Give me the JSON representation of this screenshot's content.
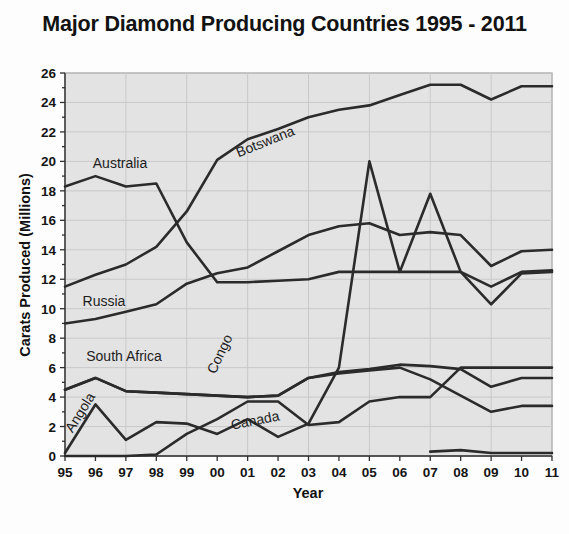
{
  "chart_data": {
    "type": "line",
    "title": "Major Diamond Producing Countries 1995 - 2011",
    "xlabel": "Year",
    "ylabel": "Carats Produced (Millions)",
    "categories": [
      "95",
      "96",
      "97",
      "98",
      "99",
      "00",
      "01",
      "02",
      "03",
      "04",
      "05",
      "06",
      "07",
      "08",
      "09",
      "10",
      "11"
    ],
    "x": [
      1995,
      1996,
      1997,
      1998,
      1999,
      2000,
      2001,
      2002,
      2003,
      2004,
      2005,
      2006,
      2007,
      2008,
      2009,
      2010,
      2011
    ],
    "xlim": [
      1995,
      2011
    ],
    "ylim": [
      0,
      26
    ],
    "ytick_step": 2,
    "yticks": [
      0,
      2,
      4,
      6,
      8,
      10,
      12,
      14,
      16,
      18,
      20,
      22,
      24,
      26
    ],
    "grid": true,
    "legend": "inline-labels",
    "series": [
      {
        "name": "Botswana",
        "label_x": 267,
        "label_y": 146,
        "label_rotate": -22,
        "values": [
          11.5,
          12.3,
          13.0,
          14.2,
          16.6,
          20.1,
          21.5,
          22.2,
          23.0,
          23.5,
          23.8,
          24.5,
          25.2,
          25.2,
          24.2,
          25.1,
          25.1
        ]
      },
      {
        "name": "Australia",
        "label_x": 120,
        "label_y": 168,
        "label_rotate": 0,
        "values": [
          18.3,
          19.0,
          18.3,
          18.5,
          14.5,
          11.8,
          11.8,
          11.9,
          12.0,
          12.5,
          12.5,
          12.5,
          12.5,
          12.5,
          11.5,
          12.5,
          12.6
        ]
      },
      {
        "name": "Russia",
        "label_x": 104,
        "label_y": 306,
        "label_rotate": 0,
        "values": [
          9.0,
          9.3,
          9.8,
          10.3,
          11.7,
          12.4,
          12.8,
          13.9,
          15.0,
          15.6,
          15.8,
          15.0,
          15.2,
          15.0,
          12.9,
          13.9,
          14.0
        ]
      },
      {
        "name": "Congo",
        "label_x": 224,
        "label_y": 356,
        "label_rotate": -65,
        "values": [
          4.5,
          5.3,
          4.4,
          4.3,
          4.2,
          4.1,
          4.0,
          4.1,
          5.3,
          5.7,
          5.9,
          6.2,
          6.1,
          5.9,
          4.7,
          5.3,
          5.3
        ]
      },
      {
        "name": "South Africa",
        "label_x": 124,
        "label_y": 361,
        "label_rotate": 0,
        "values": [
          4.5,
          5.3,
          4.4,
          4.3,
          4.2,
          4.1,
          4.0,
          4.1,
          5.3,
          5.6,
          5.8,
          6.0,
          5.2,
          4.1,
          3.0,
          3.4,
          3.4
        ]
      },
      {
        "name": "Angola",
        "label_x": 84,
        "label_y": 415,
        "label_rotate": -58,
        "values": [
          0.2,
          3.5,
          1.1,
          2.3,
          2.2,
          1.5,
          2.5,
          1.3,
          2.2,
          6.0,
          20.0,
          12.5,
          17.8,
          12.5,
          10.3,
          12.4,
          12.5
        ]
      },
      {
        "name": "Canada",
        "label_x": 256,
        "label_y": 425,
        "label_rotate": -11,
        "values": [
          0.0,
          0.0,
          0.0,
          0.1,
          1.5,
          2.5,
          3.7,
          3.7,
          2.1,
          2.3,
          3.7,
          4.0,
          4.0,
          6.0,
          6.0,
          6.0,
          6.0
        ]
      },
      {
        "name": "Angola-collapse",
        "label_x": null,
        "label_y": null,
        "label_rotate": 0,
        "values": [
          null,
          null,
          null,
          null,
          null,
          null,
          null,
          null,
          null,
          null,
          null,
          null,
          0.3,
          0.4,
          0.2,
          0.2,
          0.2
        ]
      }
    ]
  },
  "colors": {
    "line": "#2b2b2b",
    "plot_background": "#e3e3e3",
    "grid": "#c9c9c9",
    "page_background": "#fdfdfd",
    "text": "#121212"
  }
}
